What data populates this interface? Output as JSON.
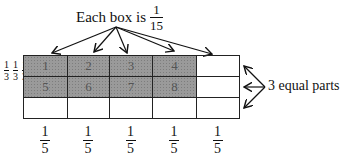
{
  "title": {
    "prefix": "Each box is",
    "numerator": "1",
    "denominator": "15"
  },
  "grid": {
    "rows": 3,
    "cols": 5,
    "cells": [
      {
        "label": "1",
        "shaded": true
      },
      {
        "label": "2",
        "shaded": true
      },
      {
        "label": "3",
        "shaded": true
      },
      {
        "label": "4",
        "shaded": true
      },
      {
        "label": "",
        "shaded": false
      },
      {
        "label": "5",
        "shaded": true
      },
      {
        "label": "6",
        "shaded": true
      },
      {
        "label": "7",
        "shaded": true
      },
      {
        "label": "8",
        "shaded": true
      },
      {
        "label": "",
        "shaded": false
      },
      {
        "label": "",
        "shaded": false
      },
      {
        "label": "",
        "shaded": false
      },
      {
        "label": "",
        "shaded": false
      },
      {
        "label": "",
        "shaded": false
      },
      {
        "label": "",
        "shaded": false
      }
    ]
  },
  "row_fractions": [
    {
      "numerator": "1",
      "denominator": "3"
    },
    {
      "numerator": "1",
      "denominator": "3"
    },
    {
      "numerator": "1",
      "denominator": "3"
    }
  ],
  "col_fractions": [
    {
      "numerator": "1",
      "denominator": "5"
    },
    {
      "numerator": "1",
      "denominator": "5"
    },
    {
      "numerator": "1",
      "denominator": "5"
    },
    {
      "numerator": "1",
      "denominator": "5"
    },
    {
      "numerator": "1",
      "denominator": "5"
    }
  ],
  "side_label": "3 equal parts"
}
